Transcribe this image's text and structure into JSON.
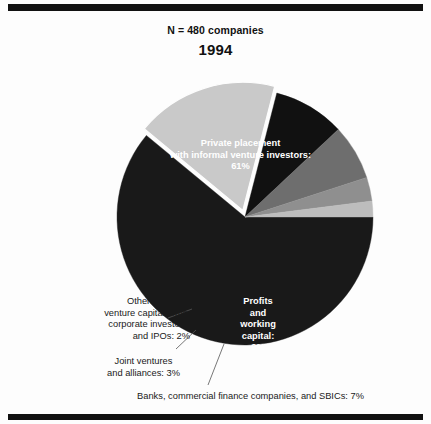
{
  "header": {
    "sample_note": "N = 480 companies",
    "year": "1994"
  },
  "chart_data": {
    "type": "pie",
    "title": "1994",
    "subtitle": "N = 480 companies",
    "total_n": 480,
    "unit": "percent",
    "legend_position": "none",
    "grid": false,
    "categories": [
      "Private placement with informal venture investors",
      "Self, family, friends, and business contacts",
      "Profits and working capital",
      "Banks, commercial finance companies, and SBICs",
      "Joint ventures and alliances",
      "Other: Includes venture capital firms, corporate investors, and IPOs"
    ],
    "values": [
      61,
      18,
      9,
      7,
      3,
      2
    ],
    "slice_colors": [
      "#191919",
      "#c9c9c9",
      "#111111",
      "#6e6e6e",
      "#8f8f8f",
      "#bdbdbd"
    ],
    "labels": [
      {
        "name": "private-placement",
        "value": 61,
        "lines": [
          "Private placement",
          "with informal venture investors:",
          "61%"
        ],
        "placement": "inside",
        "text_color": "#ffffff"
      },
      {
        "name": "self-family-friends",
        "value": 18,
        "lines": [
          "Self, family, friends,",
          "and",
          "business contacts:",
          "18%"
        ],
        "placement": "inside",
        "text_color": "#1a1a1a"
      },
      {
        "name": "profits-working-capital",
        "value": 9,
        "lines": [
          "Profits",
          "and",
          "working",
          "capital:",
          "9%"
        ],
        "placement": "inside",
        "text_color": "#ffffff"
      },
      {
        "name": "banks-finance-sbics",
        "value": 7,
        "lines": [
          "Banks, commercial finance companies, and SBICs: 7%"
        ],
        "placement": "callout",
        "text_color": "#1a1a1a"
      },
      {
        "name": "joint-ventures-alliances",
        "value": 3,
        "lines": [
          "Joint ventures",
          "and alliances: 3%"
        ],
        "placement": "callout",
        "text_color": "#1a1a1a"
      },
      {
        "name": "other-vc-corporate-ipos",
        "value": 2,
        "lines": [
          "Other: Includes",
          "venture capital firms,",
          "corporate investors,",
          "and IPOs: 2%"
        ],
        "placement": "callout",
        "text_color": "#1a1a1a"
      }
    ]
  },
  "labels_text": {
    "private_l1": "Private placement",
    "private_l2": "with informal venture investors:",
    "private_l3": "61%",
    "self_l1": "Self, family, friends,",
    "self_l2": "and",
    "self_l3": "business contacts:",
    "self_l4": "18%",
    "profits_l1": "Profits",
    "profits_l2": "and",
    "profits_l3": "working",
    "profits_l4": "capital:",
    "profits_l5": "9%",
    "other_l1": "Other: Includes",
    "other_l2": "venture capital firms,",
    "other_l3": "corporate investors,",
    "other_l4": "and IPOs: 2%",
    "joint_l1": "Joint ventures",
    "joint_l2": "and alliances: 3%",
    "banks_l1": "Banks, commercial finance companies, and SBICs: 7%"
  },
  "colors": {
    "rule": "#111111",
    "background": "#fdfdfd",
    "ink": "#1a1a1a",
    "slice_dark": "#191919",
    "slice_black": "#111111",
    "slice_light": "#c9c9c9",
    "slice_midgray": "#8f8f8f",
    "slice_darkgray": "#6e6e6e",
    "slice_paleGray": "#bdbdbd"
  }
}
